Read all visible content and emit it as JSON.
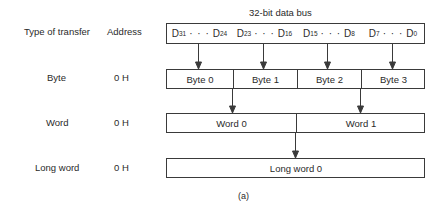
{
  "title": "32-bit data bus",
  "headers": {
    "type": "Type of transfer",
    "address": "Address"
  },
  "bus_fields": [
    {
      "hi": "31",
      "lo": "24"
    },
    {
      "hi": "23",
      "lo": "16"
    },
    {
      "hi": "15",
      "lo": "8"
    },
    {
      "hi": "7",
      "lo": "0"
    }
  ],
  "bus_prefix": "D",
  "dots": "· · ·",
  "rows": [
    {
      "type": "Byte",
      "address": "0 H",
      "cells": [
        "Byte 0",
        "Byte 1",
        "Byte 2",
        "Byte 3"
      ]
    },
    {
      "type": "Word",
      "address": "0 H",
      "cells": [
        "Word 0",
        "Word 1"
      ]
    },
    {
      "type": "Long word",
      "address": "0 H",
      "cells": [
        "Long word 0"
      ]
    }
  ],
  "caption": "(a)",
  "colors": {
    "line": "#3a3a3a",
    "text": "#2a2a2a",
    "background": "#ffffff"
  }
}
